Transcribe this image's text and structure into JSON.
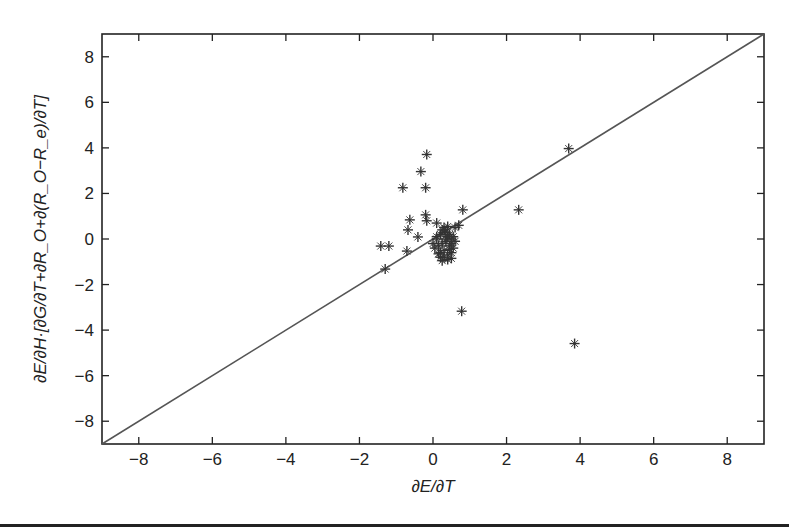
{
  "chart_data": {
    "type": "scatter",
    "title": "",
    "xlabel": "∂E/∂T",
    "ylabel": "∂E/∂H·[∂G/∂T+∂R_O+∂(R_O−R_e)/∂T]",
    "xlim": [
      -9,
      9
    ],
    "ylim": [
      -9,
      9
    ],
    "xticks": [
      -8,
      -6,
      -4,
      -2,
      0,
      2,
      4,
      6,
      8
    ],
    "yticks": [
      -8,
      -6,
      -4,
      -2,
      0,
      2,
      4,
      6,
      8
    ],
    "xtick_labels": [
      "−8",
      "−6",
      "−4",
      "−2",
      "0",
      "2",
      "4",
      "6",
      "8"
    ],
    "ytick_labels": [
      "−8",
      "−6",
      "−4",
      "−2",
      "0",
      "2",
      "4",
      "6",
      "8"
    ],
    "grid": false,
    "legend": null,
    "marker": "*",
    "marker_color": "#333333",
    "reference_line": {
      "label": "y = x",
      "from": [
        -9,
        -9
      ],
      "to": [
        9,
        9
      ],
      "color": "#555555"
    },
    "series": [
      {
        "name": "points",
        "x": [
          -0.17,
          -0.33,
          -0.82,
          -0.2,
          0.81,
          3.69,
          2.33,
          0.78,
          3.85,
          -0.63,
          -0.68,
          -0.2,
          -0.17,
          0.1,
          -0.41,
          -1.42,
          -1.2,
          -0.71,
          -1.3,
          0.6,
          0.7,
          0.0,
          0.1,
          0.2,
          0.3,
          0.4,
          0.5,
          0.6,
          0.05,
          0.15,
          0.25,
          0.35,
          0.45,
          0.55,
          0.2,
          0.3,
          0.4,
          0.5,
          0.1,
          0.25,
          0.35,
          0.45,
          0.55,
          0.3,
          0.4,
          0.2,
          0.5,
          0.35,
          0.45,
          0.15,
          0.3,
          0.4,
          0.5,
          0.25
        ],
        "y": [
          3.71,
          2.96,
          2.25,
          2.25,
          1.28,
          3.97,
          1.28,
          -3.17,
          -4.59,
          0.84,
          0.4,
          1.06,
          0.8,
          0.7,
          0.09,
          -0.31,
          -0.31,
          -0.53,
          -1.32,
          0.5,
          0.6,
          -0.2,
          0.0,
          0.2,
          0.3,
          0.1,
          0.0,
          -0.1,
          -0.4,
          -0.3,
          -0.2,
          -0.1,
          -0.3,
          -0.4,
          -0.6,
          -0.5,
          -0.7,
          -0.6,
          0.1,
          0.4,
          0.3,
          0.2,
          0.1,
          -0.8,
          -0.9,
          -0.8,
          -0.85,
          0.0,
          -0.45,
          -0.65,
          0.5,
          0.55,
          -0.2,
          -0.95
        ]
      }
    ]
  }
}
